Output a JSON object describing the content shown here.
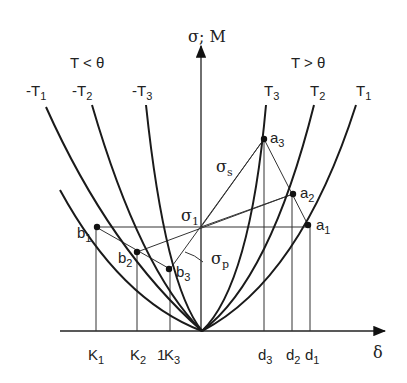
{
  "axes": {
    "y_label": "σ; M",
    "x_label": "δ",
    "origin_label": "1"
  },
  "regions": {
    "left": "T <  θ",
    "right": "T >  θ"
  },
  "curves": {
    "left": [
      {
        "name": "-T",
        "sub": "1"
      },
      {
        "name": "-T",
        "sub": "2"
      },
      {
        "name": "-T",
        "sub": "3"
      }
    ],
    "right": [
      {
        "name": "T",
        "sub": "3"
      },
      {
        "name": "T",
        "sub": "2"
      },
      {
        "name": "T",
        "sub": "1"
      }
    ]
  },
  "points": {
    "b1": {
      "base": "b",
      "sub": "1"
    },
    "b2": {
      "base": "b",
      "sub": "2"
    },
    "b3": {
      "base": "b",
      "sub": "3"
    },
    "a1": {
      "base": "a",
      "sub": "1"
    },
    "a2": {
      "base": "a",
      "sub": "2"
    },
    "a3": {
      "base": "a",
      "sub": "3"
    },
    "sigma1": {
      "base": "σ",
      "sub": "1"
    }
  },
  "lines": {
    "sigma_s": {
      "base": "σ",
      "sub": "s"
    },
    "sigma_p": {
      "base": "σ",
      "sub": "p"
    }
  },
  "x_ticks": [
    {
      "base": "K",
      "sub": "1"
    },
    {
      "base": "K",
      "sub": "2"
    },
    {
      "base": "K",
      "sub": "3"
    },
    {
      "base": "d",
      "sub": "3"
    },
    {
      "base": "d",
      "sub": "2"
    },
    {
      "base": "d",
      "sub": "1"
    }
  ],
  "colors": {
    "ink": "#1a1a1a",
    "background": "#ffffff"
  }
}
